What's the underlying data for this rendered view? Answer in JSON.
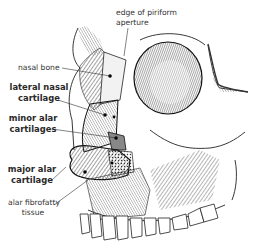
{
  "figure": {
    "labels": [
      {
        "id": "edge-of-piriform-aperture",
        "lines": [
          "edge of piriform",
          "aperture"
        ],
        "bold": false
      },
      {
        "id": "nasal-bone",
        "lines": [
          "nasal bone"
        ],
        "bold": false
      },
      {
        "id": "lateral-nasal-cartilage",
        "lines": [
          "lateral nasal",
          "cartilage"
        ],
        "bold": true
      },
      {
        "id": "minor-alar-cartilages",
        "lines": [
          "minor alar",
          "cartilages"
        ],
        "bold": true
      },
      {
        "id": "major-alar-cartilage",
        "lines": [
          "major alar",
          "cartilage"
        ],
        "bold": true
      },
      {
        "id": "alar-fibrofatty-tissue",
        "lines": [
          "alar fibrofatty",
          "tissue"
        ],
        "bold": false
      }
    ],
    "colors": {
      "ink": "#1e1e1e",
      "label_text": "#333333",
      "cartilage_shade": "#9a9a9a",
      "background": "#ffffff"
    }
  }
}
